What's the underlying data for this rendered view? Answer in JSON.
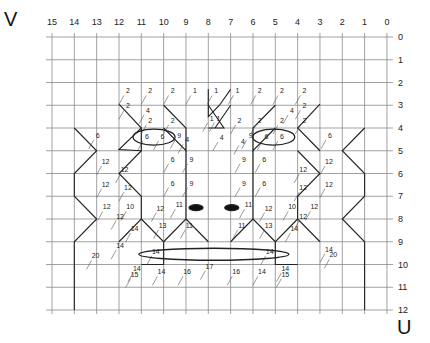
{
  "axes": {
    "v_label": "V",
    "u_label": "U",
    "column_labels": [
      "15",
      "14",
      "13",
      "12",
      "11",
      "10",
      "9",
      "8",
      "7",
      "6",
      "5",
      "4",
      "3",
      "2",
      "1",
      "0"
    ],
    "row_labels": [
      "0",
      "1",
      "2",
      "3",
      "4",
      "5",
      "6",
      "7",
      "8",
      "9",
      "10",
      "11",
      "12"
    ]
  },
  "grid": {
    "x0": 52,
    "dx": 22.33,
    "y0": 37,
    "dy": 22.75,
    "line_color": "#8a8a8a",
    "stroke_color": "#222222"
  },
  "labels": [
    {
      "t": "2",
      "c": 11.6,
      "r": 2.35
    },
    {
      "t": "2",
      "c": 10.6,
      "r": 2.35
    },
    {
      "t": "2",
      "c": 9.6,
      "r": 2.35
    },
    {
      "t": "1",
      "c": 8.6,
      "r": 2.35
    },
    {
      "t": "1",
      "c": 7.65,
      "r": 2.35
    },
    {
      "t": "1",
      "c": 6.7,
      "r": 2.35
    },
    {
      "t": "2",
      "c": 5.7,
      "r": 2.35
    },
    {
      "t": "2",
      "c": 4.7,
      "r": 2.35
    },
    {
      "t": "2",
      "c": 3.7,
      "r": 2.35
    },
    {
      "t": "2",
      "c": 11.6,
      "r": 3.0
    },
    {
      "t": "4",
      "c": 10.7,
      "r": 3.2
    },
    {
      "t": "4",
      "c": 4.25,
      "r": 3.2
    },
    {
      "t": "2",
      "c": 3.7,
      "r": 3.0
    },
    {
      "t": "2",
      "c": 10.6,
      "r": 3.65
    },
    {
      "t": "2",
      "c": 9.6,
      "r": 3.65
    },
    {
      "t": "1",
      "c": 7.85,
      "r": 3.55
    },
    {
      "t": "1",
      "c": 7.55,
      "r": 3.55
    },
    {
      "t": "2",
      "c": 6.6,
      "r": 3.65
    },
    {
      "t": "2",
      "c": 5.7,
      "r": 3.65
    },
    {
      "t": "2",
      "c": 4.7,
      "r": 3.65
    },
    {
      "t": "2",
      "c": 3.7,
      "r": 3.65
    },
    {
      "t": "9",
      "c": 9.3,
      "r": 4.3
    },
    {
      "t": "4",
      "c": 8.95,
      "r": 4.5
    },
    {
      "t": "4",
      "c": 7.4,
      "r": 4.4
    },
    {
      "t": "4",
      "c": 6.45,
      "r": 4.55
    },
    {
      "t": "9",
      "c": 6.1,
      "r": 4.3
    },
    {
      "t": "6",
      "c": 12.95,
      "r": 4.3
    },
    {
      "t": "6",
      "c": 10.75,
      "r": 4.35
    },
    {
      "t": "6",
      "c": 10.05,
      "r": 4.35
    },
    {
      "t": "6",
      "c": 5.4,
      "r": 4.35
    },
    {
      "t": "6",
      "c": 4.7,
      "r": 4.35
    },
    {
      "t": "6",
      "c": 2.55,
      "r": 4.3
    },
    {
      "t": "12",
      "c": 12.6,
      "r": 5.45
    },
    {
      "t": "6",
      "c": 9.6,
      "r": 5.35
    },
    {
      "t": "9",
      "c": 8.75,
      "r": 5.35
    },
    {
      "t": "9",
      "c": 6.4,
      "r": 5.35
    },
    {
      "t": "6",
      "c": 5.5,
      "r": 5.35
    },
    {
      "t": "12",
      "c": 2.6,
      "r": 5.45
    },
    {
      "t": "12",
      "c": 11.75,
      "r": 5.8
    },
    {
      "t": "12",
      "c": 3.75,
      "r": 5.8
    },
    {
      "t": "12",
      "c": 12.6,
      "r": 6.45
    },
    {
      "t": "12",
      "c": 11.6,
      "r": 6.6
    },
    {
      "t": "6",
      "c": 9.6,
      "r": 6.4
    },
    {
      "t": "9",
      "c": 8.75,
      "r": 6.4
    },
    {
      "t": "9",
      "c": 6.4,
      "r": 6.4
    },
    {
      "t": "6",
      "c": 5.5,
      "r": 6.4
    },
    {
      "t": "12",
      "c": 3.75,
      "r": 6.6
    },
    {
      "t": "12",
      "c": 2.6,
      "r": 6.45
    },
    {
      "t": "12",
      "c": 12.55,
      "r": 7.45
    },
    {
      "t": "10",
      "c": 11.5,
      "r": 7.45
    },
    {
      "t": "12",
      "c": 10.15,
      "r": 7.5
    },
    {
      "t": "11",
      "c": 9.3,
      "r": 7.35
    },
    {
      "t": "11",
      "c": 6.2,
      "r": 7.35
    },
    {
      "t": "12",
      "c": 5.3,
      "r": 7.5
    },
    {
      "t": "10",
      "c": 4.25,
      "r": 7.45
    },
    {
      "t": "12",
      "c": 3.25,
      "r": 7.45
    },
    {
      "t": "12",
      "c": 11.95,
      "r": 7.85
    },
    {
      "t": "12",
      "c": 3.75,
      "r": 7.85
    },
    {
      "t": "13",
      "c": 10.05,
      "r": 8.25
    },
    {
      "t": "11",
      "c": 8.85,
      "r": 8.25
    },
    {
      "t": "11",
      "c": 6.5,
      "r": 8.25
    },
    {
      "t": "13",
      "c": 5.3,
      "r": 8.25
    },
    {
      "t": "14",
      "c": 11.3,
      "r": 8.4
    },
    {
      "t": "14",
      "c": 4.15,
      "r": 8.4
    },
    {
      "t": "14",
      "c": 11.95,
      "r": 9.15
    },
    {
      "t": "14",
      "c": 10.35,
      "r": 9.4
    },
    {
      "t": "14",
      "c": 5.25,
      "r": 9.4
    },
    {
      "t": "14",
      "c": 2.6,
      "r": 9.3
    },
    {
      "t": "20",
      "c": 13.05,
      "r": 9.6
    },
    {
      "t": "20",
      "c": 2.4,
      "r": 9.55
    },
    {
      "t": "14",
      "c": 11.2,
      "r": 10.15
    },
    {
      "t": "15",
      "c": 11.3,
      "r": 10.4
    },
    {
      "t": "14",
      "c": 10.1,
      "r": 10.3
    },
    {
      "t": "16",
      "c": 8.95,
      "r": 10.3
    },
    {
      "t": "17",
      "c": 7.95,
      "r": 10.05
    },
    {
      "t": "16",
      "c": 6.75,
      "r": 10.3
    },
    {
      "t": "14",
      "c": 5.6,
      "r": 10.3
    },
    {
      "t": "14",
      "c": 4.55,
      "r": 10.15
    },
    {
      "t": "15",
      "c": 4.55,
      "r": 10.4
    }
  ],
  "features": {
    "left_eye_ellipse": {
      "c": 10.43,
      "r": 4.4,
      "rx": 21,
      "ry": 8
    },
    "right_eye_ellipse": {
      "c": 5.07,
      "r": 4.4,
      "rx": 21,
      "ry": 8
    },
    "left_pupil": {
      "c": 8.55,
      "r": 7.5,
      "rx": 7,
      "ry": 3
    },
    "right_pupil": {
      "c": 6.95,
      "r": 7.5,
      "rx": 7,
      "ry": 3
    },
    "mouth_ellipse": {
      "c": 7.75,
      "r": 9.55,
      "rx": 75,
      "ry": 6
    }
  }
}
